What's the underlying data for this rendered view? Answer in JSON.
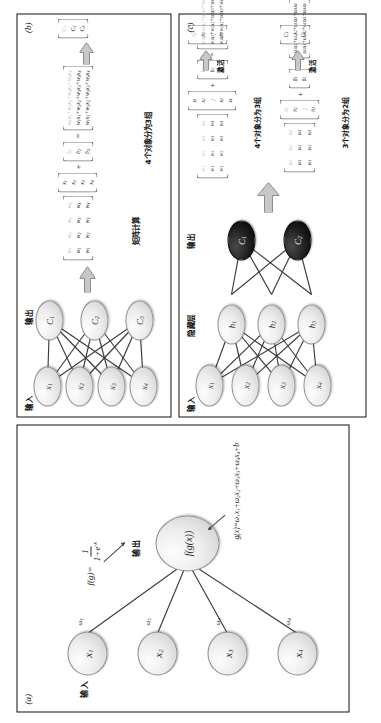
{
  "figure": {
    "orientation": "rotated-90-ccw",
    "panels": [
      "(a)",
      "(b)",
      "(c)"
    ]
  },
  "panel_a": {
    "tag": "(a)",
    "input_label": "输入",
    "output_label": "输出",
    "input_nodes": [
      "x1",
      "x2",
      "x3",
      "x4"
    ],
    "weight_labels": [
      "ω1",
      "ω2",
      "ω3",
      "ω4"
    ],
    "output_node": "f(g(x))",
    "activation_label": "f(g)=",
    "activation_numerator": "1",
    "activation_denominator": "1+e",
    "activation_exponent": "-x",
    "linear_equation": "g(x)=ω1x1+ω2x2+ω3x3+ω4x4+b"
  },
  "panel_b": {
    "tag": "(b)",
    "input_label": "输入",
    "output_label": "输出",
    "input_nodes": [
      "x1",
      "x2",
      "x3",
      "x4"
    ],
    "output_nodes": [
      "C1",
      "C2",
      "C3"
    ],
    "matrix_caption": "矩阵计算",
    "grouping_caption": "4个对象分为3组",
    "weight_matrix": [
      [
        "w1",
        "w2",
        "w3",
        "w4"
      ],
      [
        "w1",
        "w2",
        "w3",
        "w4"
      ],
      [
        "w1",
        "w2",
        "w3",
        "w4"
      ]
    ],
    "input_vector": [
      "x1",
      "x2",
      "x3",
      "x4"
    ],
    "bias_vector": [
      "b1",
      "b2",
      "b3"
    ],
    "result_vector": [
      "w1x1+w2x2+w3x3+w4x4",
      "w1x1+w2x2+w3x3+w4x4",
      "w1x1+w2x2+w3x3+w4x4"
    ],
    "class_vector": [
      "C1",
      "C2",
      "C3"
    ],
    "operators": {
      "plus": "+",
      "equals": "="
    }
  },
  "panel_c": {
    "tag": "(c)",
    "input_label": "输入",
    "hidden_label": "隐藏层",
    "output_label": "输出",
    "input_nodes": [
      "x1",
      "x2",
      "x3",
      "x4"
    ],
    "hidden_nodes": [
      "h1",
      "h2",
      "h3"
    ],
    "output_nodes": [
      "C1",
      "C2"
    ],
    "activation_label": "激活",
    "block1": {
      "grouping_caption": "4个对象分为3组",
      "weight_matrix": [
        [
          "w1",
          "w2",
          "w3",
          "w4"
        ],
        [
          "w1",
          "w2",
          "w3",
          "w4"
        ],
        [
          "w1",
          "w2",
          "w3",
          "w4"
        ]
      ],
      "input_vector": [
        "x1",
        "x2",
        "x3",
        "x4"
      ],
      "bias_vector": [
        "b1",
        "b2",
        "b3"
      ],
      "result_vector": [
        "w1x1+w2x2+w3x3+w4x4",
        "w1x1+w2x2+w3x3+w4x4",
        "w1x1+w2x2+w3x3+w4x4"
      ],
      "activated_vector": [
        "h1",
        "h2",
        "h3"
      ]
    },
    "block2": {
      "grouping_caption": "3个对象分为2组",
      "weight_matrix": [
        [
          "ω1",
          "ω2",
          "ω3"
        ],
        [
          "ω1",
          "ω2",
          "ω3"
        ]
      ],
      "input_vector": [
        "h1",
        "h2",
        "h3"
      ],
      "bias_vector": [
        "β1",
        "β2"
      ],
      "result_vector": [
        "ω1x1+ω2x2+ω3x3+ω4x4",
        "ω1x1+ω2x2+ω3x3+ω4x4"
      ],
      "activated_vector": [
        "C1",
        "C2"
      ]
    },
    "operators": {
      "plus": "+",
      "equals": "=",
      "ellipsis": "⋮"
    }
  },
  "colors": {
    "node_light": "#e9e9e9",
    "node_dark": "#0d0d0d",
    "edge": "#3c3c3c",
    "arrow_fill": "#c8c8c8",
    "border": "#111111"
  }
}
